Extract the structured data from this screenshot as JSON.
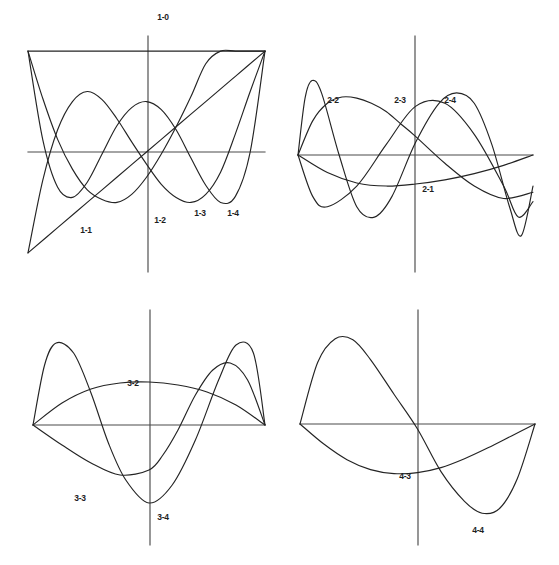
{
  "figure": {
    "title": "",
    "background_color": "#ffffff",
    "line_color": "#242424",
    "axis_color": "#4a4a4a",
    "panel_count": 4
  },
  "chart_data": {
    "type": "line",
    "title": "",
    "xlabel": "",
    "ylabel": "",
    "grid": false,
    "legend_position": "inline-annotations",
    "xlim": [
      -1,
      1
    ],
    "ylim": [
      -1.15,
      1.15
    ],
    "panels": [
      {
        "id": "panel-1",
        "name": "panel-top-left",
        "axis_box": {
          "x_left": 28,
          "x_right": 265,
          "y_axis_x": 148,
          "y_zero": 152,
          "y_top": 36,
          "y_bottom": 272
        },
        "curves": [
          {
            "label": "1-0",
            "label_pos": {
              "x": 163,
              "y": 17
            },
            "points_x": [
              -1.0,
              -0.5,
              0.0,
              0.5,
              1.0
            ],
            "points_y": [
              1.0,
              1.0,
              1.0,
              1.0,
              1.0
            ],
            "note": "constant unity line across the top"
          },
          {
            "label": "1-1",
            "label_pos": {
              "x": 86,
              "y": 230
            },
            "points_x": [
              -1.0,
              -0.75,
              -0.5,
              -0.25,
              0.0,
              0.25,
              0.5,
              0.75,
              1.0
            ],
            "points_y": [
              -1.0,
              -0.75,
              -0.5,
              -0.25,
              0.0,
              0.25,
              0.5,
              0.75,
              1.0
            ],
            "note": "straight line y = x"
          },
          {
            "label": "1-2",
            "label_pos": {
              "x": 160,
              "y": 220
            },
            "points_x": [
              -1.0,
              -0.875,
              -0.75,
              -0.625,
              -0.5,
              -0.375,
              -0.25,
              -0.125,
              0.0,
              0.125,
              0.25,
              0.375,
              0.5,
              0.625,
              0.75,
              0.875,
              1.0
            ],
            "points_y": [
              1.0,
              0.53,
              0.125,
              -0.17,
              -0.375,
              -0.47,
              -0.5,
              -0.42,
              -0.25,
              -0.02,
              0.25,
              0.55,
              0.875,
              1.0,
              1.0,
              1.0,
              1.0
            ],
            "note": "rises to unity at the right end"
          },
          {
            "label": "1-3",
            "label_pos": {
              "x": 200,
              "y": 213
            },
            "points_x": [
              -1.0,
              -0.875,
              -0.75,
              -0.625,
              -0.5,
              -0.375,
              -0.25,
              -0.125,
              0.0,
              0.125,
              0.25,
              0.375,
              0.5,
              0.625,
              0.75,
              0.875,
              1.0
            ],
            "points_y": [
              -1.0,
              -0.28,
              0.22,
              0.5,
              0.6,
              0.52,
              0.33,
              0.1,
              -0.12,
              -0.32,
              -0.45,
              -0.5,
              -0.42,
              -0.2,
              0.18,
              0.6,
              1.0
            ],
            "note": "cubic-like oscillation"
          },
          {
            "label": "1-4",
            "label_pos": {
              "x": 233,
              "y": 213
            },
            "points_x": [
              -1.0,
              -0.875,
              -0.75,
              -0.625,
              -0.5,
              -0.375,
              -0.25,
              -0.125,
              0.0,
              0.125,
              0.25,
              0.375,
              0.5,
              0.625,
              0.75,
              0.875,
              1.0
            ],
            "points_y": [
              1.0,
              0.12,
              -0.35,
              -0.45,
              -0.3,
              -0.02,
              0.26,
              0.44,
              0.5,
              0.42,
              0.22,
              -0.06,
              -0.33,
              -0.5,
              -0.44,
              0.0,
              1.0
            ],
            "note": "quartic-like oscillation"
          }
        ]
      },
      {
        "id": "panel-2",
        "name": "panel-top-right",
        "axis_box": {
          "x_left": 298,
          "x_right": 533,
          "y_axis_x": 415,
          "y_zero": 155,
          "y_top": 36,
          "y_bottom": 272
        },
        "curves": [
          {
            "label": "2-1",
            "label_pos": {
              "x": 428,
              "y": 189
            },
            "points_x": [
              -1.0,
              -0.75,
              -0.5,
              -0.25,
              0.0,
              0.25,
              0.5,
              0.75,
              1.0
            ],
            "points_y": [
              0.0,
              -0.17,
              -0.27,
              -0.3,
              -0.28,
              -0.24,
              -0.18,
              -0.1,
              0.0
            ],
            "note": "shallow negative bowl"
          },
          {
            "label": "2-2",
            "label_pos": {
              "x": 333,
              "y": 100
            },
            "points_x": [
              -1.0,
              -0.875,
              -0.75,
              -0.625,
              -0.5,
              -0.375,
              -0.25,
              -0.125,
              0.0,
              0.25,
              0.5,
              0.75,
              1.0
            ],
            "points_y": [
              0.0,
              0.33,
              0.5,
              0.56,
              0.55,
              0.5,
              0.42,
              0.3,
              0.18,
              -0.08,
              -0.3,
              -0.42,
              -0.36
            ],
            "note": "broad positive arch on the left"
          },
          {
            "label": "2-3",
            "label_pos": {
              "x": 400,
              "y": 100
            },
            "points_x": [
              -1.0,
              -0.875,
              -0.75,
              -0.5,
              -0.25,
              0.0,
              0.25,
              0.5,
              0.75,
              0.875,
              1.0
            ],
            "points_y": [
              0.0,
              -0.4,
              -0.5,
              -0.3,
              0.1,
              0.47,
              0.5,
              0.2,
              -0.3,
              -0.6,
              -0.45
            ],
            "note": "one full oscillation, peak near origin"
          },
          {
            "label": "2-4",
            "label_pos": {
              "x": 450,
              "y": 100
            },
            "points_x": [
              -1.0,
              -0.94,
              -0.88,
              -0.8,
              -0.65,
              -0.5,
              -0.35,
              -0.2,
              0.0,
              0.2,
              0.35,
              0.5,
              0.65,
              0.8,
              0.9,
              1.0
            ],
            "points_y": [
              0.0,
              0.55,
              0.72,
              0.6,
              0.0,
              -0.5,
              -0.6,
              -0.4,
              0.12,
              0.5,
              0.6,
              0.5,
              0.1,
              -0.5,
              -0.78,
              -0.3
            ],
            "note": "highest-frequency curve with sharp end lobes"
          }
        ]
      },
      {
        "id": "panel-3",
        "name": "panel-bottom-left",
        "axis_box": {
          "x_left": 33,
          "x_right": 265,
          "y_axis_x": 150,
          "y_zero": 425,
          "y_top": 310,
          "y_bottom": 545
        },
        "curves": [
          {
            "label": "3-2",
            "label_pos": {
              "x": 133,
              "y": 383
            },
            "points_x": [
              -1.0,
              -0.75,
              -0.5,
              -0.25,
              0.0,
              0.25,
              0.5,
              0.75,
              1.0
            ],
            "points_y": [
              0.0,
              0.22,
              0.36,
              0.42,
              0.43,
              0.4,
              0.33,
              0.2,
              0.0
            ],
            "note": "shallow positive arch spanning the interval"
          },
          {
            "label": "3-3",
            "label_pos": {
              "x": 80,
              "y": 498
            },
            "points_x": [
              -1.0,
              -0.9,
              -0.8,
              -0.65,
              -0.5,
              -0.35,
              -0.2,
              0.0,
              0.2,
              0.4,
              0.6,
              0.75,
              0.9,
              1.0
            ],
            "points_y": [
              0.0,
              0.6,
              0.82,
              0.72,
              0.32,
              -0.18,
              -0.55,
              -0.78,
              -0.6,
              -0.15,
              0.45,
              0.8,
              0.72,
              0.0
            ],
            "note": "large amplitude wave with lobes at both ends"
          },
          {
            "label": "3-4",
            "label_pos": {
              "x": 163,
              "y": 517
            },
            "points_x": [
              -1.0,
              -0.75,
              -0.5,
              -0.25,
              0.0,
              0.12,
              0.25,
              0.4,
              0.55,
              0.7,
              0.85,
              1.0
            ],
            "points_y": [
              0.0,
              -0.2,
              -0.38,
              -0.5,
              -0.45,
              -0.3,
              -0.05,
              0.3,
              0.55,
              0.62,
              0.45,
              0.0
            ],
            "note": "dips below axis on the left then peaks on the right"
          }
        ]
      },
      {
        "id": "panel-4",
        "name": "panel-bottom-right",
        "axis_box": {
          "x_left": 300,
          "x_right": 535,
          "y_axis_x": 418,
          "y_zero": 424,
          "y_top": 310,
          "y_bottom": 545
        },
        "curves": [
          {
            "label": "4-3",
            "label_pos": {
              "x": 405,
              "y": 476
            },
            "points_x": [
              -1.0,
              -0.8,
              -0.6,
              -0.4,
              -0.2,
              0.0,
              0.2,
              0.4,
              0.6,
              0.8,
              1.0
            ],
            "points_y": [
              0.0,
              -0.2,
              -0.36,
              -0.46,
              -0.5,
              -0.49,
              -0.44,
              -0.35,
              -0.24,
              -0.12,
              0.0
            ],
            "note": "smooth negative bowl, minimum just left of the origin"
          },
          {
            "label": "4-4",
            "label_pos": {
              "x": 478,
              "y": 530
            },
            "points_x": [
              -1.0,
              -0.85,
              -0.7,
              -0.55,
              -0.4,
              -0.2,
              0.0,
              0.2,
              0.4,
              0.55,
              0.7,
              0.85,
              1.0
            ],
            "points_y": [
              0.0,
              0.62,
              0.86,
              0.85,
              0.65,
              0.3,
              -0.05,
              -0.48,
              -0.78,
              -0.9,
              -0.85,
              -0.55,
              0.0
            ],
            "note": "full sine-like oscillation, positive then negative"
          }
        ]
      }
    ]
  }
}
